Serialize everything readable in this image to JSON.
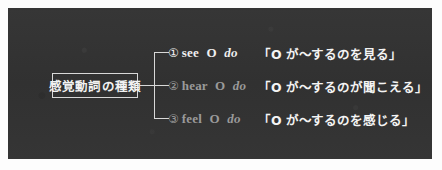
{
  "figure": {
    "panel_color": "#333333",
    "line_color": "#d8d8d8",
    "page_color": "#fdfdfd"
  },
  "root": {
    "label": "感覚動詞の種類"
  },
  "rows": [
    {
      "marker": "①",
      "verb": "see",
      "object": "O",
      "complement": "do",
      "japanese": "「O が〜するのを見る」",
      "tone": "bright",
      "text_color": "#efefef"
    },
    {
      "marker": "②",
      "verb": "hear",
      "object": "O",
      "complement": "do",
      "japanese": "「O が〜するのが聞こえる」",
      "tone": "dim",
      "text_color": "#9a9a9a"
    },
    {
      "marker": "③",
      "verb": "feel",
      "object": "O",
      "complement": "do",
      "japanese": "「O が〜するのを感じる」",
      "tone": "dim",
      "text_color": "#9a9a9a"
    }
  ]
}
